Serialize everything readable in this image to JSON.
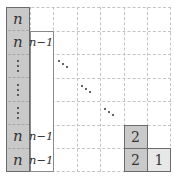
{
  "diagram": {
    "title": "",
    "grid": {
      "rows": 7,
      "cols": 7,
      "line_style": "dashed",
      "line_color": "#c4c4c4"
    },
    "colors": {
      "dark_fill": "#c9c9c9",
      "light_fill": "#e8e8e8",
      "border": "#6b6b6b",
      "column2_border": "#8a8a8a"
    },
    "column_n": {
      "labels": [
        "n",
        "n",
        "⋮",
        "⋮",
        "⋮",
        "n",
        "n"
      ]
    },
    "column_n_minus_1": {
      "labels": [
        "n−1",
        "",
        "",
        "",
        "n−1",
        "n−1"
      ]
    },
    "diagonal_dots": [
      "⋱",
      "⋱",
      "⋱"
    ],
    "bottom_right": {
      "row5_col5": "2",
      "row6_col5": "2",
      "row6_col6": "1"
    }
  }
}
